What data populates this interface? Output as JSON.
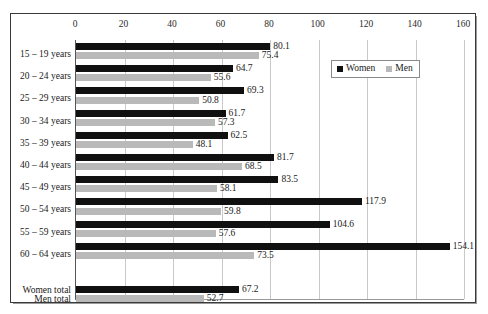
{
  "chart_data": {
    "type": "bar",
    "orientation": "horizontal",
    "title": "",
    "xlabel": "",
    "ylabel": "",
    "xlim": [
      0,
      160
    ],
    "xticks": [
      0,
      20,
      40,
      60,
      80,
      100,
      120,
      140,
      160
    ],
    "grid": true,
    "legend": {
      "position": "top-right",
      "entries": [
        {
          "name": "Women",
          "color": "#101010"
        },
        {
          "name": "Men",
          "color": "#b9b9b9"
        }
      ]
    },
    "categories": [
      "15 – 19 years",
      "20 – 24 years",
      "25 – 29 years",
      "30 – 34 years",
      "35 – 39 years",
      "40 – 44 years",
      "45 – 49 years",
      "50 – 54 years",
      "55 – 59 years",
      "60 – 64 years"
    ],
    "series": [
      {
        "name": "Women",
        "color": "#101010",
        "values": [
          80.1,
          64.7,
          69.3,
          61.7,
          62.5,
          81.7,
          83.5,
          117.9,
          104.6,
          154.1
        ]
      },
      {
        "name": "Men",
        "color": "#b9b9b9",
        "values": [
          75.4,
          55.6,
          50.8,
          57.3,
          48.1,
          68.5,
          58.1,
          59.8,
          57.6,
          73.5
        ]
      }
    ],
    "totals": [
      {
        "label": "Women total",
        "value": 67.2,
        "color": "#101010"
      },
      {
        "label": "Men total",
        "value": 52.7,
        "color": "#b9b9b9"
      }
    ]
  }
}
